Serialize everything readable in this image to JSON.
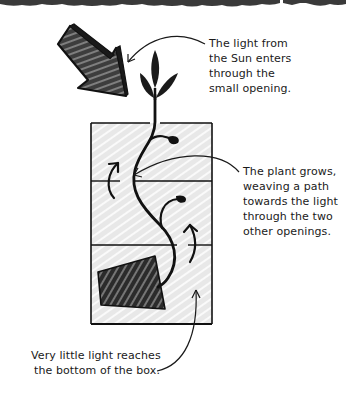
{
  "diagram": {
    "callouts": {
      "sun": {
        "lines": [
          "The light from",
          "the Sun enters",
          "through the",
          "small opening."
        ]
      },
      "plant": {
        "lines": [
          "The plant grows,",
          "weaving a path",
          "towards the light",
          "through the two",
          "other openings."
        ]
      },
      "bottom": {
        "lines": [
          "Very little light reaches",
          "the bottom of the box."
        ]
      }
    },
    "elements": {
      "sun_arrow": "sunlight-arrow-icon",
      "plant": "plant-icon",
      "box": "box-with-two-partitions",
      "obstacle": "dark-block",
      "growth_arrows": [
        "growth-arrow-upper-left",
        "growth-arrow-lower-right"
      ]
    },
    "colors": {
      "ink": "#1a1a1a",
      "box_fill": "#e9e9e9",
      "hatch": "#ffffff",
      "torn_edge": "#3a3a3a",
      "background": "#ffffff"
    }
  }
}
